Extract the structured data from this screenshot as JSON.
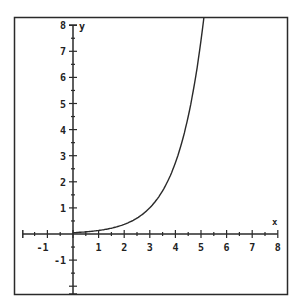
{
  "caption": "",
  "colors": {
    "ink": "#2a2a2a",
    "background": "#ffffff"
  },
  "chart_data": {
    "type": "line",
    "title": "",
    "xlabel": "x",
    "ylabel": "y",
    "xlim": [
      -2,
      8
    ],
    "ylim": [
      -3,
      8
    ],
    "x_ticks": [
      -1,
      1,
      2,
      3,
      4,
      5,
      6,
      7,
      8
    ],
    "y_ticks": [
      -1,
      1,
      2,
      3,
      4,
      5,
      6,
      7,
      8
    ],
    "minor_ticks_per_unit": 2,
    "grid": false,
    "legend": null,
    "series": [
      {
        "name": "curve",
        "description": "exponential growth curve, approx y = e^x / 20",
        "x": [
          -2,
          -1,
          0,
          0.5,
          1,
          1.5,
          2,
          2.5,
          3,
          3.5,
          4,
          4.5,
          5,
          5.1
        ],
        "y": [
          0.007,
          0.018,
          0.05,
          0.08,
          0.14,
          0.22,
          0.37,
          0.61,
          1.0,
          1.66,
          2.73,
          4.5,
          7.42,
          8.2
        ]
      }
    ]
  }
}
